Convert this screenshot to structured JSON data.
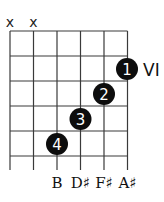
{
  "chord_diagram": {
    "strings": 6,
    "frets_shown": 5,
    "position_marker": "VI",
    "muted_strings": [
      {
        "string_index": 0,
        "symbol": "x"
      },
      {
        "string_index": 1,
        "symbol": "x"
      }
    ],
    "fingers": [
      {
        "finger": "1",
        "string_index": 5,
        "fret_row": 1
      },
      {
        "finger": "2",
        "string_index": 4,
        "fret_row": 2
      },
      {
        "finger": "3",
        "string_index": 3,
        "fret_row": 3
      },
      {
        "finger": "4",
        "string_index": 2,
        "fret_row": 4
      }
    ],
    "note_labels": [
      {
        "string_index": 2,
        "label": "B"
      },
      {
        "string_index": 3,
        "label": "D♯"
      },
      {
        "string_index": 4,
        "label": "F♯"
      },
      {
        "string_index": 5,
        "label": "A♯"
      }
    ],
    "colors": {
      "line": "#3a3a3a",
      "dot": "#0d0d0d",
      "dot_text": "#ffffff"
    }
  }
}
